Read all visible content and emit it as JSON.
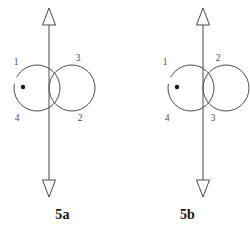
{
  "figure": {
    "title_visible": false,
    "background_color": "#ffffff",
    "stroke_color": "#4a4a4a",
    "label_color": "#4a4a4a",
    "caption_color": "#141414",
    "panels": [
      {
        "id": "5a",
        "caption": "5a",
        "axis": {
          "orientation": "vertical",
          "top_arrowhead": "open-triangle-up",
          "bottom_arrowhead": "open-triangle-down"
        },
        "basepoint": "filled-dot",
        "loops": 2,
        "labels": {
          "top_left": "1",
          "top_right": "3",
          "bottom_left": "4",
          "bottom_right": "2"
        }
      },
      {
        "id": "5b",
        "caption": "5b",
        "axis": {
          "orientation": "vertical",
          "top_arrowhead": "open-triangle-up",
          "bottom_arrowhead": "open-triangle-down"
        },
        "basepoint": "filled-dot",
        "loops": 2,
        "labels": {
          "top_left": "1",
          "top_right": "2",
          "bottom_left": "4",
          "bottom_right": "3"
        }
      }
    ]
  }
}
